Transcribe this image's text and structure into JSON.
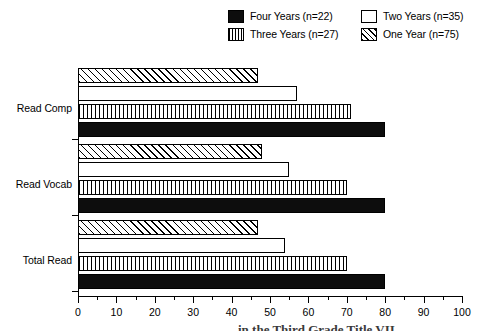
{
  "chart_data": {
    "type": "bar",
    "orientation": "horizontal",
    "title": "",
    "xlabel": "",
    "ylabel": "",
    "xlim": [
      0,
      100
    ],
    "categories": [
      "Read Comp",
      "Read Vocab",
      "Total Read"
    ],
    "grid": false,
    "legend_position": "top-right",
    "xticks": [
      0,
      10,
      20,
      30,
      40,
      50,
      60,
      70,
      80,
      90,
      100
    ],
    "minor_tick_interval": 5,
    "series": [
      {
        "name": "Four Years (n=22)",
        "pattern": "solid",
        "values": [
          80,
          80,
          80
        ]
      },
      {
        "name": "Three Years (n=27)",
        "pattern": "vertical-lines",
        "values": [
          71,
          70,
          70
        ]
      },
      {
        "name": "Two Years (n=35)",
        "pattern": "open",
        "values": [
          57,
          55,
          54
        ]
      },
      {
        "name": "One Year (n=75)",
        "pattern": "diagonal-hatch",
        "values": [
          47,
          48,
          47
        ]
      }
    ]
  },
  "legend": {
    "items": [
      {
        "label": "Four Years (n=22)",
        "swatch": "solid-swatch"
      },
      {
        "label": "Three Years (n=27)",
        "swatch": "vertical-lines-swatch"
      },
      {
        "label": "Two Years (n=35)",
        "swatch": "open-swatch"
      },
      {
        "label": "One Year (n=75)",
        "swatch": "diagonal-hatch-swatch"
      }
    ]
  },
  "axis": {
    "x_tick_labels": [
      "0",
      "10",
      "20",
      "30",
      "40",
      "50",
      "60",
      "70",
      "80",
      "90",
      "100"
    ],
    "category_labels": [
      "Read Comp",
      "Read Vocab",
      "Total Read"
    ]
  },
  "caption": {
    "text": "in the Third Grade Title VII"
  },
  "colors": {
    "ink": "#000000",
    "fill_solid": "#0d0d0d",
    "background": "#ffffff"
  }
}
